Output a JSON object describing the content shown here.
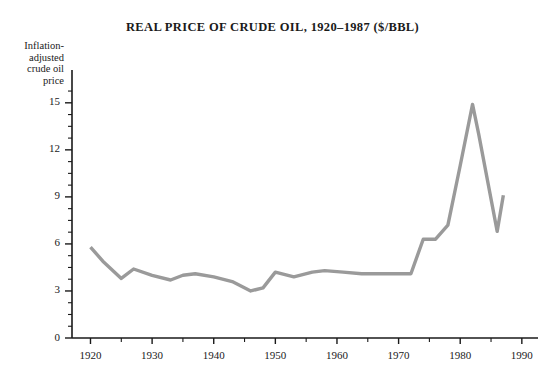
{
  "chart_data": {
    "type": "line",
    "title": "REAL PRICE OF CRUDE OIL, 1920–1987 ($/BBL)",
    "xlabel": "",
    "ylabel": "Inflation-adjusted crude oil price",
    "ylabel_lines": [
      "Inflation-",
      "adjusted",
      "crude oil",
      "price"
    ],
    "xlim": [
      1917,
      1991
    ],
    "ylim": [
      0,
      16.2
    ],
    "grid": false,
    "legend": null,
    "line_color": "#9a9a9a",
    "axis_color": "#1a1a1a",
    "xticks": [
      1920,
      1930,
      1940,
      1950,
      1960,
      1970,
      1980,
      1990
    ],
    "xtick_labels": [
      "1920",
      "1930",
      "1940",
      "1950",
      "1960",
      "1970",
      "1980",
      "1990"
    ],
    "xminor_step": 5,
    "yticks": [
      0,
      3,
      6,
      9,
      12,
      15
    ],
    "ytick_labels": [
      "0",
      "3",
      "6",
      "9",
      "12",
      "15"
    ],
    "yminor_step": 0.75,
    "x": [
      1920,
      1922,
      1925,
      1927,
      1930,
      1933,
      1935,
      1937,
      1940,
      1943,
      1946,
      1948,
      1950,
      1953,
      1956,
      1958,
      1961,
      1964,
      1967,
      1970,
      1972,
      1974,
      1976,
      1978,
      1980,
      1982,
      1983,
      1986,
      1987
    ],
    "values": [
      5.8,
      4.9,
      3.8,
      4.4,
      4.0,
      3.7,
      4.0,
      4.1,
      3.9,
      3.6,
      3.0,
      3.2,
      4.2,
      3.9,
      4.2,
      4.3,
      4.2,
      4.1,
      4.1,
      4.1,
      4.1,
      6.3,
      6.3,
      7.2,
      11.0,
      14.9,
      13.0,
      6.8,
      9.1
    ],
    "series_name": "Inflation-adjusted crude oil price",
    "notes": {
      "peak_year": 1982,
      "peak_value": 14.9,
      "trough_year": 1946,
      "trough_value": 3.0,
      "start_value": 5.8,
      "end_value": 9.1
    }
  }
}
